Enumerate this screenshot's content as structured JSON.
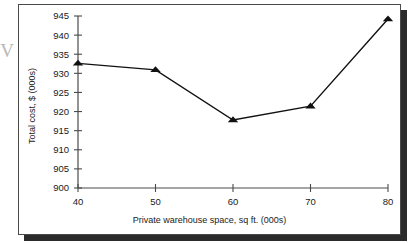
{
  "figure": {
    "artifact_mark": "V",
    "background_color": "#ffffff",
    "frame_color": "#4a4a4a",
    "shadow_color": "#2b2b2b"
  },
  "chart_data": {
    "type": "line",
    "title": "",
    "xlabel": "Private warehouse space, sq ft. (000s)",
    "ylabel": "Total cost, $ (000s)",
    "x": [
      40,
      50,
      60,
      70,
      80
    ],
    "values": [
      932.6,
      930.9,
      917.8,
      921.4,
      944.2
    ],
    "series": [
      {
        "name": "Total cost",
        "x": [
          40,
          50,
          60,
          70,
          80
        ],
        "values": [
          932.6,
          930.9,
          917.8,
          921.4,
          944.2
        ]
      }
    ],
    "xlim": [
      40,
      80
    ],
    "ylim": [
      900,
      945
    ],
    "xticks": [
      40,
      50,
      60,
      70,
      80
    ],
    "yticks": [
      900,
      905,
      910,
      915,
      920,
      925,
      930,
      935,
      940,
      945
    ],
    "xtick_labels": [
      "40",
      "50",
      "60",
      "70",
      "80"
    ],
    "ytick_labels": [
      "900",
      "905",
      "910",
      "915",
      "920",
      "925",
      "930",
      "935",
      "940",
      "945"
    ],
    "grid": false,
    "legend": "none",
    "marker": "triangle-up",
    "marker_color": "#111111",
    "line_color": "#111111",
    "line_width": 1.4
  }
}
